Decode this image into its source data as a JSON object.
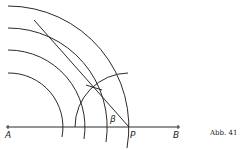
{
  "figure": {
    "caption": "Abb. 41",
    "points": {
      "A": "A",
      "P": "P",
      "B": "B"
    },
    "angle_label": "β"
  }
}
